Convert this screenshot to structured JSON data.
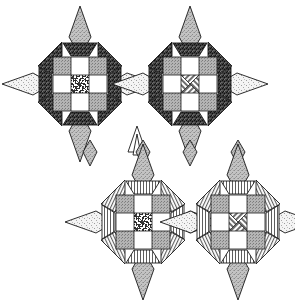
{
  "figure": {
    "title_fragment": "can cuckle",
    "background_color": "#ffffff",
    "width": 295,
    "height": 306,
    "outline_color": "#1a1a1a"
  },
  "palette": {
    "dark_speckle": "#3b3b3b",
    "mid_gray": "#9a9a9a",
    "light_gray": "#c9c9c9",
    "pale": "#efefef",
    "white": "#ffffff",
    "line": "#1a1a1a"
  },
  "motifs": [
    {
      "id": "motif-top-left",
      "position": "top-left",
      "center": {
        "x": 80,
        "y": 84
      },
      "ring_fill": "dark-speckle",
      "center_block_fill": "maze-dense",
      "corner_square_fill": "mid-gray",
      "vertical_point_fill": "stipple-gray",
      "horizontal_point_fill": "stipple-pale",
      "point_count": 8
    },
    {
      "id": "motif-top-right",
      "position": "top-right",
      "center": {
        "x": 190,
        "y": 84
      },
      "ring_fill": "dark-speckle",
      "center_block_fill": "diagonal-hatch",
      "corner_square_fill": "mid-gray",
      "vertical_point_fill": "stipple-gray",
      "horizontal_point_fill": "stipple-pale",
      "point_count": 8
    },
    {
      "id": "motif-bottom-left",
      "position": "bottom-left",
      "center": {
        "x": 143,
        "y": 222
      },
      "ring_fill": "line-stripe",
      "center_block_fill": "maze-dense",
      "corner_square_fill": "mid-gray",
      "vertical_point_fill": "stipple-gray",
      "horizontal_point_fill": "stipple-pale",
      "point_count": 8
    },
    {
      "id": "motif-bottom-right",
      "position": "bottom-right",
      "center": {
        "x": 238,
        "y": 222
      },
      "ring_fill": "line-stripe",
      "center_block_fill": "diagonal-hatch",
      "corner_square_fill": "mid-gray",
      "vertical_point_fill": "stipple-gray",
      "horizontal_point_fill": "stipple-pale",
      "point_count": 8
    }
  ],
  "fragments": [
    {
      "id": "chevron-center",
      "shape": "zigzag",
      "x": 137,
      "y": 122
    },
    {
      "id": "partial-point-left",
      "shape": "half-diamond",
      "x": 90,
      "y": 140
    },
    {
      "id": "partial-point-mid",
      "shape": "half-diamond",
      "x": 143,
      "y": 140
    },
    {
      "id": "partial-point-right",
      "shape": "half-diamond",
      "x": 190,
      "y": 140
    },
    {
      "id": "partial-point-far-right",
      "shape": "half-diamond",
      "x": 238,
      "y": 140
    }
  ]
}
